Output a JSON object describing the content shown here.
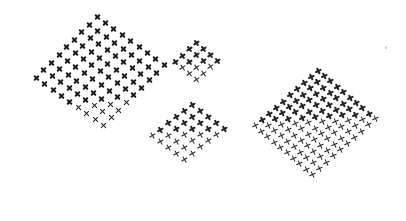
{
  "canvas": {
    "width": 406,
    "height": 221,
    "background": "#ffffff"
  },
  "clusters": [
    {
      "name": "cluster-top-left",
      "origin": [
        97,
        17
      ],
      "u": [
        8.4,
        6.0
      ],
      "v": [
        -7.6,
        7.6
      ],
      "cols": 9,
      "rows": 9,
      "color": "#1a1a1a",
      "fade_start": 0.75,
      "mark_rotation": 0
    },
    {
      "name": "cluster-top-middle",
      "origin": [
        196,
        42
      ],
      "u": [
        7.0,
        6.0
      ],
      "v": [
        -7.0,
        6.5
      ],
      "cols": 4,
      "rows": 4,
      "color": "#222222",
      "fade_start": 0.6,
      "mark_rotation": 10
    },
    {
      "name": "cluster-bottom-middle",
      "origin": [
        192,
        104
      ],
      "u": [
        8.0,
        6.0
      ],
      "v": [
        -8.0,
        6.3
      ],
      "cols": 5,
      "rows": 6,
      "color": "#222222",
      "fade_start": 0.5,
      "mark_rotation": 15
    },
    {
      "name": "cluster-right",
      "origin": [
        318,
        70
      ],
      "u": [
        6.4,
        5.4
      ],
      "v": [
        -7.0,
        6.2
      ],
      "cols": 10,
      "rows": 10,
      "color": "#222222",
      "fade_start": 0.45,
      "mark_rotation": 20
    }
  ],
  "specks": [
    [
      385,
      46
    ]
  ]
}
